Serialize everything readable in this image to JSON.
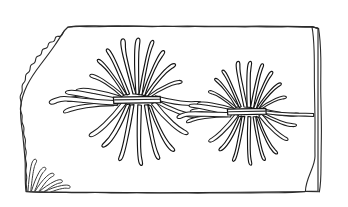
{
  "document": {
    "kind": "line-drawing",
    "subject": "fossil-slab-with-radiating-organisms",
    "title": "",
    "caption": "",
    "background_color": "#ffffff",
    "ink_color": "#1f1f1f",
    "canvas": {
      "width": 348,
      "height": 207
    }
  },
  "slab": {
    "name": "rock slab",
    "fill_color": "#ffffff",
    "outline_color": "#2b2b2b",
    "description": "rectangular stone slab, straight top and bottom edges, irregular broken left edge, beveled right edge",
    "edges": {
      "top": "slightly wavy near-horizontal",
      "bottom": "slightly wavy near-horizontal",
      "left": "irregular rough-broken bulging curve",
      "right": "double line beveled corner"
    }
  },
  "specimens": [
    {
      "id": "specimen-left",
      "label": "left radiating organism",
      "center_x": 138,
      "center_y": 98,
      "arm_count": 23,
      "has_central_bar": true,
      "bar_orientation": "horizontal",
      "relative_size": "large"
    },
    {
      "id": "specimen-right",
      "label": "right radiating organism",
      "center_x": 247,
      "center_y": 110,
      "arm_count": 22,
      "has_central_bar": true,
      "bar_orientation": "horizontal",
      "relative_size": "medium"
    },
    {
      "id": "specimen-corner",
      "label": "partial organism at bottom left corner",
      "center_x": 28,
      "center_y": 191,
      "arm_count": 5,
      "has_central_bar": false,
      "bar_orientation": "none",
      "relative_size": "fragmentary"
    }
  ],
  "legend": {
    "visible": false,
    "entries": []
  }
}
